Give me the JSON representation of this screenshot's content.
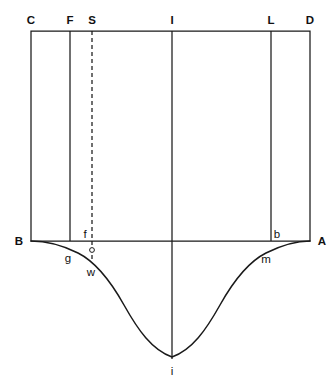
{
  "figure": {
    "background_color": "#ffffff",
    "line_color": "#1a1a1a",
    "labels": {
      "top": {
        "c": "C",
        "f": "F",
        "s": "S",
        "i": "I",
        "l": "L",
        "d": "D"
      },
      "mid": {
        "b_left": "B",
        "f_lower": "f",
        "b_right": "b",
        "a_right": "A"
      },
      "lower": {
        "g": "g",
        "w": "w",
        "m": "m"
      },
      "bottom": {
        "i_lower": "i"
      }
    },
    "geometry": {
      "rect_left_x": 31,
      "rect_right_x": 310,
      "rect_top_y": 31,
      "baseline_y": 241,
      "vline_f_x": 70,
      "vline_s_x": 92,
      "vline_i_x": 172,
      "vline_l_x": 271,
      "curve_min_y": 357,
      "marker_circle_x": 92,
      "marker_circle_y": 250,
      "marker_circle_r": 2.4
    },
    "elements": {
      "rectangle": "rectangle-CDAB",
      "dashed_line": "dashed-line-S",
      "curve": "trough-curve-BA",
      "center_line": "vertical-line-I"
    }
  }
}
